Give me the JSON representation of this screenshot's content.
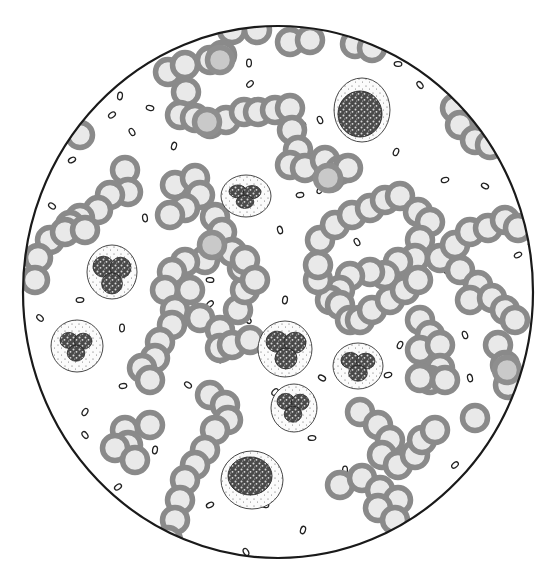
{
  "figure": {
    "field": {
      "cx": 278,
      "cy": 292,
      "rx": 255,
      "ry": 266,
      "border_color": "#1a1a1a"
    },
    "colors": {
      "rbc_fill": "#e9e9e9",
      "rbc_ring": "#8a8a8a",
      "background": "#ffffff"
    },
    "rbc": [
      [
        232,
        30
      ],
      [
        257,
        30
      ],
      [
        290,
        42
      ],
      [
        310,
        40
      ],
      [
        355,
        44
      ],
      [
        372,
        48
      ],
      [
        168,
        72
      ],
      [
        185,
        65
      ],
      [
        210,
        60
      ],
      [
        222,
        55
      ],
      [
        186,
        92
      ],
      [
        180,
        115
      ],
      [
        195,
        118
      ],
      [
        210,
        124
      ],
      [
        226,
        120
      ],
      [
        244,
        112
      ],
      [
        258,
        112
      ],
      [
        275,
        110
      ],
      [
        290,
        108
      ],
      [
        292,
        130
      ],
      [
        298,
        150
      ],
      [
        290,
        165
      ],
      [
        305,
        168
      ],
      [
        325,
        160
      ],
      [
        340,
        170
      ],
      [
        330,
        178
      ],
      [
        348,
        168
      ],
      [
        455,
        108
      ],
      [
        460,
        125
      ],
      [
        475,
        140
      ],
      [
        490,
        145
      ],
      [
        490,
        112
      ],
      [
        80,
        135
      ],
      [
        125,
        170
      ],
      [
        128,
        192
      ],
      [
        110,
        195
      ],
      [
        98,
        210
      ],
      [
        80,
        218
      ],
      [
        70,
        225
      ],
      [
        50,
        240
      ],
      [
        38,
        258
      ],
      [
        35,
        280
      ],
      [
        65,
        232
      ],
      [
        85,
        230
      ],
      [
        175,
        185
      ],
      [
        195,
        178
      ],
      [
        200,
        195
      ],
      [
        185,
        208
      ],
      [
        170,
        215
      ],
      [
        215,
        217
      ],
      [
        222,
        232
      ],
      [
        205,
        260
      ],
      [
        185,
        262
      ],
      [
        172,
        272
      ],
      [
        165,
        290
      ],
      [
        175,
        310
      ],
      [
        172,
        325
      ],
      [
        160,
        342
      ],
      [
        155,
        358
      ],
      [
        142,
        368
      ],
      [
        150,
        380
      ],
      [
        190,
        290
      ],
      [
        200,
        318
      ],
      [
        220,
        330
      ],
      [
        238,
        310
      ],
      [
        245,
        290
      ],
      [
        242,
        268
      ],
      [
        232,
        252
      ],
      [
        245,
        260
      ],
      [
        255,
        280
      ],
      [
        220,
        348
      ],
      [
        232,
        345
      ],
      [
        250,
        340
      ],
      [
        320,
        240
      ],
      [
        335,
        225
      ],
      [
        352,
        215
      ],
      [
        370,
        208
      ],
      [
        385,
        200
      ],
      [
        400,
        196
      ],
      [
        418,
        212
      ],
      [
        430,
        222
      ],
      [
        420,
        240
      ],
      [
        415,
        258
      ],
      [
        398,
        262
      ],
      [
        385,
        275
      ],
      [
        370,
        272
      ],
      [
        350,
        276
      ],
      [
        340,
        290
      ],
      [
        330,
        300
      ],
      [
        318,
        280
      ],
      [
        318,
        265
      ],
      [
        340,
        305
      ],
      [
        350,
        320
      ],
      [
        360,
        320
      ],
      [
        372,
        310
      ],
      [
        390,
        300
      ],
      [
        405,
        290
      ],
      [
        418,
        280
      ],
      [
        440,
        258
      ],
      [
        455,
        245
      ],
      [
        470,
        232
      ],
      [
        488,
        228
      ],
      [
        505,
        220
      ],
      [
        518,
        228
      ],
      [
        460,
        270
      ],
      [
        478,
        285
      ],
      [
        470,
        300
      ],
      [
        492,
        298
      ],
      [
        505,
        310
      ],
      [
        515,
        320
      ],
      [
        420,
        320
      ],
      [
        430,
        335
      ],
      [
        420,
        350
      ],
      [
        440,
        345
      ],
      [
        440,
        368
      ],
      [
        430,
        380
      ],
      [
        420,
        378
      ],
      [
        445,
        380
      ],
      [
        498,
        345
      ],
      [
        505,
        365
      ],
      [
        508,
        385
      ],
      [
        125,
        430
      ],
      [
        150,
        425
      ],
      [
        128,
        445
      ],
      [
        115,
        448
      ],
      [
        135,
        460
      ],
      [
        210,
        395
      ],
      [
        225,
        405
      ],
      [
        228,
        420
      ],
      [
        215,
        430
      ],
      [
        205,
        450
      ],
      [
        195,
        465
      ],
      [
        185,
        480
      ],
      [
        180,
        500
      ],
      [
        175,
        520
      ],
      [
        168,
        540
      ],
      [
        360,
        412
      ],
      [
        378,
        425
      ],
      [
        390,
        440
      ],
      [
        382,
        455
      ],
      [
        398,
        465
      ],
      [
        415,
        455
      ],
      [
        422,
        440
      ],
      [
        435,
        430
      ],
      [
        475,
        418
      ],
      [
        340,
        485
      ],
      [
        362,
        478
      ],
      [
        380,
        490
      ],
      [
        398,
        500
      ],
      [
        378,
        508
      ],
      [
        395,
        520
      ]
    ],
    "rbc_dark": [
      [
        220,
        60
      ],
      [
        207,
        122
      ],
      [
        328,
        178
      ],
      [
        212,
        245
      ],
      [
        507,
        370
      ]
    ],
    "platelets": [
      [
        249,
        63
      ],
      [
        250,
        84
      ],
      [
        398,
        64
      ],
      [
        420,
        85
      ],
      [
        120,
        96
      ],
      [
        112,
        115
      ],
      [
        150,
        108
      ],
      [
        132,
        132
      ],
      [
        174,
        146
      ],
      [
        72,
        160
      ],
      [
        302,
        124
      ],
      [
        320,
        120
      ],
      [
        396,
        152
      ],
      [
        445,
        180
      ],
      [
        485,
        186
      ],
      [
        280,
        230
      ],
      [
        320,
        190
      ],
      [
        300,
        195
      ],
      [
        52,
        206
      ],
      [
        145,
        218
      ],
      [
        100,
        270
      ],
      [
        80,
        300
      ],
      [
        40,
        318
      ],
      [
        122,
        328
      ],
      [
        210,
        304
      ],
      [
        210,
        280
      ],
      [
        248,
        320
      ],
      [
        285,
        300
      ],
      [
        285,
        335
      ],
      [
        336,
        220
      ],
      [
        357,
        242
      ],
      [
        447,
        270
      ],
      [
        518,
        255
      ],
      [
        532,
        245
      ],
      [
        465,
        335
      ],
      [
        400,
        345
      ],
      [
        388,
        375
      ],
      [
        322,
        378
      ],
      [
        470,
        378
      ],
      [
        85,
        412
      ],
      [
        123,
        386
      ],
      [
        188,
        385
      ],
      [
        220,
        359
      ],
      [
        275,
        392
      ],
      [
        312,
        438
      ],
      [
        355,
        405
      ],
      [
        345,
        470
      ],
      [
        455,
        465
      ],
      [
        432,
        437
      ],
      [
        85,
        435
      ],
      [
        155,
        450
      ],
      [
        118,
        487
      ],
      [
        265,
        505
      ],
      [
        246,
        552
      ],
      [
        303,
        530
      ],
      [
        210,
        505
      ]
    ],
    "wbc": [
      {
        "cx": 362,
        "cy": 110,
        "rx": 28,
        "ry": 32,
        "nrx": 22,
        "nry": 23,
        "ncx": 360,
        "ncy": 114,
        "type": "monocyte"
      },
      {
        "cx": 246,
        "cy": 196,
        "rx": 25,
        "ry": 21,
        "nrx": 16,
        "nry": 13,
        "ncx": 245,
        "ncy": 196,
        "type": "neutrophil"
      },
      {
        "cx": 112,
        "cy": 272,
        "rx": 25,
        "ry": 27,
        "nrx": 19,
        "nry": 21,
        "ncx": 112,
        "ncy": 274,
        "type": "neutrophil"
      },
      {
        "cx": 77,
        "cy": 346,
        "rx": 26,
        "ry": 26,
        "nrx": 16,
        "nry": 16,
        "ncx": 76,
        "ncy": 346,
        "type": "neutrophil"
      },
      {
        "cx": 285,
        "cy": 349,
        "rx": 27,
        "ry": 28,
        "nrx": 20,
        "nry": 21,
        "ncx": 286,
        "ncy": 349,
        "type": "neutrophil"
      },
      {
        "cx": 358,
        "cy": 366,
        "rx": 25,
        "ry": 23,
        "nrx": 17,
        "nry": 16,
        "ncx": 358,
        "ncy": 366,
        "type": "neutrophil"
      },
      {
        "cx": 294,
        "cy": 408,
        "rx": 23,
        "ry": 24,
        "nrx": 16,
        "nry": 16,
        "ncx": 293,
        "ncy": 407,
        "type": "neutrophil"
      },
      {
        "cx": 252,
        "cy": 480,
        "rx": 31,
        "ry": 29,
        "nrx": 22,
        "nry": 19,
        "ncx": 250,
        "ncy": 476,
        "type": "lymphocyte"
      }
    ]
  }
}
